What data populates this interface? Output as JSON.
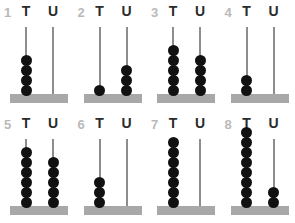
{
  "worksheet": {
    "column_headers": {
      "tens": "T",
      "units": "U"
    },
    "colors": {
      "bead": "#111111",
      "spike": "#8d8d8d",
      "base": "#a8a8a8",
      "index_numeral": "#b9b9b9",
      "header_letter": "#2b2b2b",
      "background": "#ffffff"
    }
  },
  "chart_data": {
    "type": "table",
    "categories": [
      "1",
      "2",
      "3",
      "4",
      "5",
      "6",
      "7",
      "8"
    ],
    "series": [
      {
        "name": "T",
        "values": [
          4,
          1,
          5,
          2,
          6,
          3,
          7,
          8
        ]
      },
      {
        "name": "U",
        "values": [
          0,
          3,
          4,
          0,
          5,
          0,
          0,
          2
        ]
      }
    ],
    "values": [
      40,
      13,
      54,
      20,
      65,
      30,
      70,
      82
    ],
    "xlabel": "",
    "ylabel": "",
    "legend": [
      "T",
      "U"
    ]
  },
  "abacuses": [
    {
      "index": "1",
      "tens": 4,
      "units": 0,
      "value": 40
    },
    {
      "index": "2",
      "tens": 1,
      "units": 3,
      "value": 13
    },
    {
      "index": "3",
      "tens": 5,
      "units": 4,
      "value": 54
    },
    {
      "index": "4",
      "tens": 2,
      "units": 0,
      "value": 20
    },
    {
      "index": "5",
      "tens": 6,
      "units": 5,
      "value": 65
    },
    {
      "index": "6",
      "tens": 3,
      "units": 0,
      "value": 30
    },
    {
      "index": "7",
      "tens": 7,
      "units": 0,
      "value": 70
    },
    {
      "index": "8",
      "tens": 8,
      "units": 2,
      "value": 82
    }
  ]
}
